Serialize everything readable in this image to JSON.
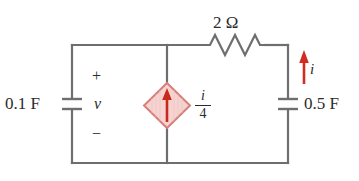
{
  "figure": {
    "name": "dependent-current-source-rc-circuit",
    "background_color": "#ffffff",
    "wire_color": "#6e6e6e",
    "source_fill_color": "#f6d3d0",
    "source_border_color": "#d4817c",
    "arrow_color": "#d32a22",
    "text_color": "#2b2b2b"
  },
  "components": {
    "capacitor_left": {
      "value_label": "0.1 F",
      "icon": "capacitor-icon"
    },
    "capacitor_right": {
      "value_label": "0.5 F",
      "icon": "capacitor-icon"
    },
    "resistor": {
      "value_label": "2 Ω",
      "icon": "resistor-icon"
    },
    "dependent_source": {
      "value_numerator": "i",
      "value_fraction_bar": "",
      "value_denominator": "4",
      "icon": "dependent-current-source-icon",
      "arrow_direction": "up"
    }
  },
  "annotations": {
    "polarity_plus": "+",
    "voltage_label": "v",
    "polarity_minus": "−",
    "current_label": "i",
    "current_arrow_icon": "up-arrow-icon"
  }
}
